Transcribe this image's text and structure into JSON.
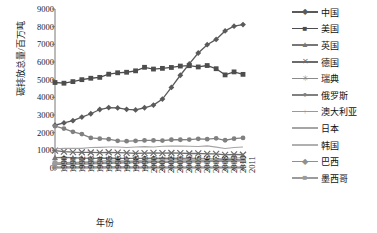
{
  "chart_data": {
    "type": "line",
    "title": "",
    "xlabel": "年份",
    "ylabel": "碳排放总量/百万吨",
    "ylim": [
      0,
      9000
    ],
    "ytick_labels": [
      "0",
      "1000",
      "2000",
      "3000",
      "4000",
      "5000",
      "6000",
      "7000",
      "8000",
      "9000"
    ],
    "yticks": [
      0,
      1000,
      2000,
      3000,
      4000,
      5000,
      6000,
      7000,
      8000,
      9000
    ],
    "grid": false,
    "legend_position": "right",
    "categories": [
      "1990",
      "1991",
      "1992",
      "1993",
      "1994",
      "1995",
      "1996",
      "1997",
      "1998",
      "1999",
      "2000",
      "2001",
      "2002",
      "2003",
      "2004",
      "2005",
      "2006",
      "2007",
      "2008",
      "2009",
      "2010",
      "2011"
    ],
    "series": [
      {
        "name": "中国",
        "marker": "diamond",
        "color": "#5a5a5a",
        "values": [
          2420,
          2550,
          2680,
          2880,
          3070,
          3310,
          3420,
          3400,
          3320,
          3290,
          3410,
          3560,
          3900,
          4560,
          5250,
          5890,
          6510,
          6980,
          7280,
          7760,
          8030,
          8120
        ]
      },
      {
        "name": "美国",
        "marker": "square",
        "color": "#4d4d4d",
        "values": [
          4840,
          4800,
          4890,
          5000,
          5080,
          5130,
          5310,
          5390,
          5420,
          5500,
          5700,
          5600,
          5640,
          5690,
          5770,
          5790,
          5720,
          5800,
          5620,
          5270,
          5440,
          5300
        ]
      },
      {
        "name": "英国",
        "marker": "triangle",
        "color": "#777777",
        "values": [
          590,
          600,
          580,
          560,
          550,
          540,
          565,
          545,
          550,
          545,
          550,
          560,
          545,
          555,
          550,
          550,
          545,
          535,
          515,
          470,
          490,
          450
        ]
      },
      {
        "name": "德国",
        "marker": "cross",
        "color": "#6b6b6b",
        "values": [
          980,
          930,
          900,
          890,
          880,
          870,
          890,
          870,
          860,
          830,
          840,
          860,
          840,
          850,
          840,
          820,
          830,
          800,
          800,
          740,
          770,
          750
        ]
      },
      {
        "name": "瑞典",
        "marker": "star",
        "color": "#8a8a8a",
        "values": [
          55,
          58,
          57,
          57,
          60,
          58,
          62,
          56,
          56,
          54,
          53,
          54,
          55,
          55,
          53,
          51,
          50,
          48,
          47,
          42,
          46,
          43
        ]
      },
      {
        "name": "俄罗斯",
        "marker": "circle",
        "color": "#808080",
        "values": [
          2370,
          2230,
          2050,
          1920,
          1700,
          1660,
          1630,
          1540,
          1520,
          1540,
          1560,
          1560,
          1550,
          1600,
          1600,
          1610,
          1650,
          1630,
          1680,
          1570,
          1660,
          1700
        ]
      },
      {
        "name": "澳大利亚",
        "marker": "plus",
        "color": "#999999",
        "values": [
          270,
          275,
          280,
          285,
          290,
          300,
          310,
          320,
          335,
          345,
          355,
          360,
          365,
          370,
          380,
          385,
          390,
          395,
          400,
          395,
          400,
          405
        ]
      },
      {
        "name": "日本",
        "marker": "none",
        "color": "#a5a5a5",
        "values": [
          1090,
          1110,
          1120,
          1110,
          1160,
          1170,
          1190,
          1190,
          1160,
          1190,
          1210,
          1190,
          1230,
          1240,
          1240,
          1230,
          1220,
          1250,
          1180,
          1100,
          1160,
          1190
        ]
      },
      {
        "name": "韩国",
        "marker": "none",
        "color": "#b0b0b0",
        "values": [
          240,
          270,
          300,
          330,
          370,
          400,
          430,
          450,
          390,
          410,
          440,
          450,
          470,
          480,
          490,
          490,
          500,
          520,
          530,
          530,
          570,
          590
        ]
      },
      {
        "name": "巴西",
        "marker": "diamond",
        "color": "#8f8f8f",
        "values": [
          200,
          210,
          215,
          220,
          230,
          250,
          265,
          280,
          290,
          300,
          310,
          320,
          320,
          320,
          330,
          340,
          350,
          365,
          385,
          370,
          400,
          420
        ]
      },
      {
        "name": "墨西哥",
        "marker": "square",
        "color": "#9b9b9b",
        "values": [
          290,
          300,
          310,
          310,
          320,
          310,
          325,
          340,
          355,
          360,
          370,
          370,
          375,
          380,
          385,
          400,
          410,
          420,
          430,
          420,
          430,
          440
        ]
      }
    ]
  },
  "legend": {
    "items": [
      {
        "label": "中国"
      },
      {
        "label": "美国"
      },
      {
        "label": "英国"
      },
      {
        "label": "德国"
      },
      {
        "label": "瑞典"
      },
      {
        "label": "俄罗斯"
      },
      {
        "label": "澳大利亚"
      },
      {
        "label": "日本"
      },
      {
        "label": "韩国"
      },
      {
        "label": "巴西"
      },
      {
        "label": "墨西哥"
      }
    ]
  }
}
